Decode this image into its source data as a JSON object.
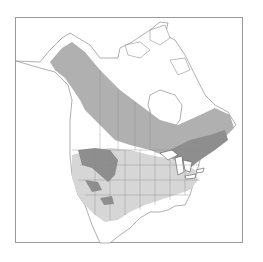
{
  "map": {
    "type": "range-map",
    "region": "North America",
    "legend": [
      {
        "name": "year-round",
        "color": "#8e8e8e"
      },
      {
        "name": "breeding",
        "color": "#b0b0b0"
      },
      {
        "name": "winter",
        "color": "#d6d6d6"
      }
    ],
    "colors": {
      "background": "#ffffff",
      "border": "#9a9a9a",
      "coastline": "#7a7a7a"
    }
  }
}
